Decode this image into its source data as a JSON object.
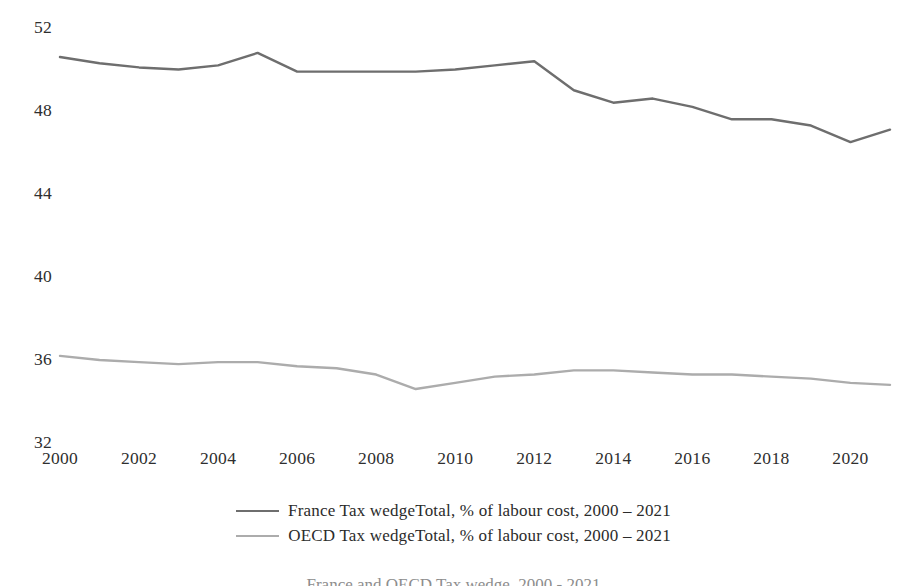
{
  "chart_data": {
    "type": "line",
    "title": "",
    "xlabel": "",
    "ylabel": "",
    "x": [
      2000,
      2001,
      2002,
      2003,
      2004,
      2005,
      2006,
      2007,
      2008,
      2009,
      2010,
      2011,
      2012,
      2013,
      2014,
      2015,
      2016,
      2017,
      2018,
      2019,
      2020,
      2021
    ],
    "xlim": [
      2000,
      2021
    ],
    "ylim": [
      32,
      52
    ],
    "yticks": [
      32,
      36,
      40,
      44,
      48,
      52
    ],
    "xticks": [
      2000,
      2002,
      2004,
      2006,
      2008,
      2010,
      2012,
      2014,
      2016,
      2018,
      2020
    ],
    "ytick_labels": [
      "32",
      "36",
      "40",
      "44",
      "48",
      "52"
    ],
    "xtick_labels": [
      "2000",
      "2002",
      "2004",
      "2006",
      "2008",
      "2010",
      "2012",
      "2014",
      "2016",
      "2018",
      "2020"
    ],
    "grid": false,
    "legend_position": "bottom",
    "series": [
      {
        "name": "France Tax wedgeTotal, % of labour cost, 2000 – 2021",
        "color": "#6e6e6e",
        "values": [
          50.6,
          50.3,
          50.1,
          50.0,
          50.2,
          50.8,
          49.9,
          49.9,
          49.9,
          49.9,
          50.0,
          50.2,
          50.4,
          49.0,
          48.4,
          48.6,
          48.2,
          47.6,
          47.6,
          47.3,
          46.5,
          47.1
        ]
      },
      {
        "name": "OECD Tax wedgeTotal, % of labour cost, 2000 – 2021",
        "color": "#acacac",
        "values": [
          36.2,
          36.0,
          35.9,
          35.8,
          35.9,
          35.9,
          35.7,
          35.6,
          35.3,
          34.6,
          34.9,
          35.2,
          35.3,
          35.5,
          35.5,
          35.4,
          35.3,
          35.3,
          35.2,
          35.1,
          34.9,
          34.8
        ]
      }
    ]
  },
  "legend": {
    "items": [
      {
        "label": "France Tax wedgeTotal, % of labour cost, 2000 – 2021",
        "color": "#6e6e6e"
      },
      {
        "label": "OECD Tax wedgeTotal, % of labour cost, 2000 – 2021",
        "color": "#acacac"
      }
    ]
  },
  "caption": {
    "text": "France and OECD Tax wedge, 2000 - 2021"
  }
}
